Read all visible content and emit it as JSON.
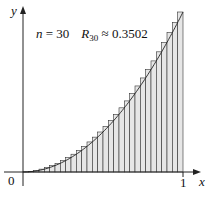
{
  "figure": {
    "annotation": {
      "n_label": "n",
      "eq": " = 30",
      "r_label": "R",
      "r_sub": "30",
      "approx": " ≈ 0.3502"
    },
    "axes": {
      "x_label": "x",
      "y_label": "y",
      "origin_label": "0",
      "x_tick_label": "1"
    }
  },
  "chart_data": {
    "type": "bar",
    "function": "y = x^2",
    "interval": [
      0,
      1
    ],
    "n": 30,
    "rule": "right endpoint",
    "R_n": 0.3502,
    "xlabel": "x",
    "ylabel": "y",
    "x_ticks": [
      "0",
      "1"
    ],
    "xlim": [
      0,
      1
    ],
    "ylim": [
      0,
      1
    ],
    "grid": false,
    "bar_fill": "#e6e6e6",
    "bar_stroke": "#333333",
    "categories": [
      0.0333,
      0.0667,
      0.1,
      0.1333,
      0.1667,
      0.2,
      0.2333,
      0.2667,
      0.3,
      0.3333,
      0.3667,
      0.4,
      0.4333,
      0.4667,
      0.5,
      0.5333,
      0.5667,
      0.6,
      0.6333,
      0.6667,
      0.7,
      0.7333,
      0.7667,
      0.8,
      0.8333,
      0.8667,
      0.9,
      0.9333,
      0.9667,
      1.0
    ],
    "values": [
      0.0011,
      0.0044,
      0.01,
      0.0178,
      0.0278,
      0.04,
      0.0544,
      0.0711,
      0.09,
      0.1111,
      0.1344,
      0.16,
      0.1878,
      0.2178,
      0.25,
      0.2844,
      0.3211,
      0.36,
      0.4011,
      0.4444,
      0.49,
      0.5378,
      0.5878,
      0.64,
      0.6944,
      0.7511,
      0.81,
      0.8711,
      0.9344,
      1.0
    ]
  }
}
